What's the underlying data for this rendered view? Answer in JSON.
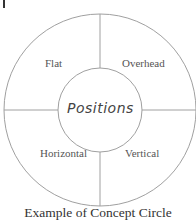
{
  "diagram": {
    "center": "Positions",
    "quadrants": {
      "top_left": "Flat",
      "top_right": "Overhead",
      "bottom_left": "Horizontal",
      "bottom_right": "Vertical"
    },
    "caption": "Example of Concept Circle",
    "line_color": "#999999"
  }
}
